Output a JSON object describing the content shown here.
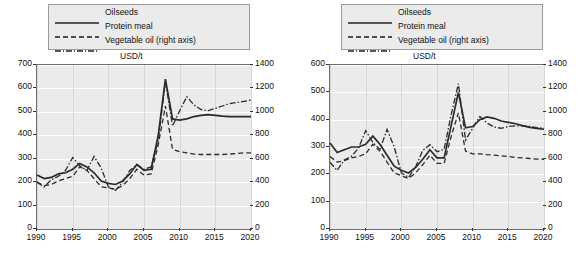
{
  "legend": {
    "items": [
      {
        "label": "Oilseeds",
        "style": "solid"
      },
      {
        "label": "Protein meal",
        "style": "dashed"
      },
      {
        "label": "Vegetable oil (right axis)",
        "style": "dashdot"
      }
    ]
  },
  "chart_data": [
    {
      "type": "line",
      "panel": "left",
      "title": "USD/t",
      "xlabel": "",
      "ylabel": "USD/t",
      "xlim": [
        1990,
        2020
      ],
      "ylim": [
        0,
        700
      ],
      "y2lim": [
        0,
        1400
      ],
      "grid": true,
      "legend_position": "top",
      "xticks": [
        "1990",
        "1995",
        "2000",
        "2005",
        "2010",
        "2015",
        "2020"
      ],
      "yticks": [
        "0",
        "100",
        "200",
        "300",
        "400",
        "500",
        "600",
        "700"
      ],
      "y2ticks": [
        "0",
        "200",
        "400",
        "600",
        "800",
        "1000",
        "1200",
        "1400"
      ],
      "x": [
        1990,
        1991,
        1992,
        1993,
        1994,
        1995,
        1996,
        1997,
        1998,
        1999,
        2000,
        2001,
        2002,
        2003,
        2004,
        2005,
        2006,
        2007,
        2008,
        2009,
        2010,
        2011,
        2012,
        2013,
        2014,
        2015,
        2016,
        2017,
        2018,
        2019,
        2020
      ],
      "series": [
        {
          "name": "Oilseeds",
          "axis": "left",
          "style": "solid",
          "values": [
            230,
            215,
            220,
            235,
            240,
            255,
            280,
            265,
            240,
            205,
            195,
            190,
            205,
            235,
            275,
            250,
            255,
            400,
            640,
            470,
            465,
            470,
            480,
            485,
            488,
            485,
            482,
            480,
            480,
            480,
            480
          ]
        },
        {
          "name": "Protein meal",
          "axis": "left",
          "style": "dashed",
          "values": [
            200,
            185,
            190,
            205,
            215,
            225,
            265,
            250,
            215,
            180,
            175,
            170,
            185,
            215,
            255,
            230,
            235,
            360,
            525,
            340,
            330,
            325,
            320,
            318,
            318,
            318,
            318,
            320,
            322,
            325,
            325
          ]
        },
        {
          "name": "Vegetable oil (right axis)",
          "axis": "right",
          "style": "dashdot",
          "values": [
            400,
            360,
            420,
            450,
            500,
            610,
            540,
            500,
            620,
            520,
            360,
            330,
            400,
            500,
            550,
            510,
            530,
            760,
            1260,
            880,
            1010,
            1130,
            1060,
            1020,
            1010,
            1030,
            1050,
            1070,
            1080,
            1090,
            1100
          ]
        }
      ]
    },
    {
      "type": "line",
      "panel": "right",
      "title": "USD/t",
      "xlabel": "",
      "ylabel": "USD/t",
      "xlim": [
        1990,
        2020
      ],
      "ylim": [
        0,
        600
      ],
      "y2lim": [
        0,
        1400
      ],
      "grid": true,
      "legend_position": "top",
      "xticks": [
        "1990",
        "1995",
        "2000",
        "2005",
        "2010",
        "2015",
        "2020"
      ],
      "yticks": [
        "0",
        "100",
        "200",
        "300",
        "400",
        "500",
        "600"
      ],
      "y2ticks": [
        "0",
        "200",
        "400",
        "600",
        "800",
        "1000",
        "1200",
        "1400"
      ],
      "x": [
        1990,
        1991,
        1992,
        1993,
        1994,
        1995,
        1996,
        1997,
        1998,
        1999,
        2000,
        2001,
        2002,
        2003,
        2004,
        2005,
        2006,
        2007,
        2008,
        2009,
        2010,
        2011,
        2012,
        2013,
        2014,
        2015,
        2016,
        2017,
        2018,
        2019,
        2020
      ],
      "series": [
        {
          "name": "Oilseeds",
          "axis": "left",
          "style": "solid",
          "values": [
            315,
            280,
            290,
            300,
            300,
            310,
            340,
            310,
            270,
            230,
            215,
            205,
            225,
            255,
            290,
            260,
            260,
            380,
            500,
            370,
            375,
            400,
            410,
            405,
            395,
            390,
            385,
            378,
            372,
            368,
            365
          ]
        },
        {
          "name": "Protein meal",
          "axis": "left",
          "style": "dashed",
          "values": [
            265,
            245,
            250,
            260,
            265,
            275,
            310,
            285,
            245,
            205,
            195,
            185,
            205,
            235,
            270,
            240,
            240,
            340,
            425,
            285,
            275,
            275,
            272,
            270,
            268,
            265,
            262,
            260,
            258,
            256,
            255
          ]
        },
        {
          "name": "Vegetable oil (right axis)",
          "axis": "right",
          "style": "dashdot",
          "values": [
            570,
            500,
            590,
            620,
            690,
            840,
            740,
            680,
            850,
            700,
            480,
            440,
            530,
            670,
            720,
            660,
            680,
            980,
            1240,
            760,
            860,
            960,
            905,
            870,
            860,
            875,
            880,
            880,
            875,
            865,
            860
          ]
        }
      ]
    }
  ]
}
